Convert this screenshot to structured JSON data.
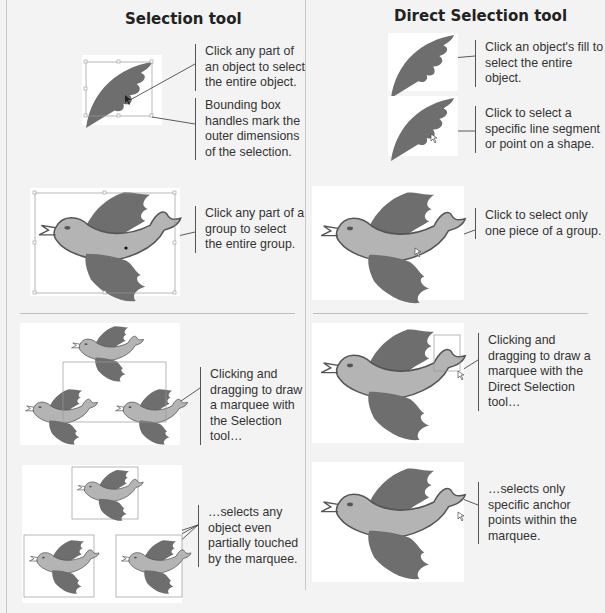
{
  "columns": [
    {
      "title": "Selection tool",
      "captions": [
        "Click any part of an object to select the entire object.",
        "Bounding box handles mark the outer dimensions of the selection.",
        "Click any part of a group to select the entire group.",
        "Clicking and dragging to draw a marquee with the Selection tool…",
        "…selects any object even partially touched by the marquee."
      ]
    },
    {
      "title": "Direct Selection tool",
      "captions": [
        "Click an object's fill to select the entire object.",
        "Click to select a specific line segment or point on a shape.",
        "Click to select only one piece of a group.",
        "Clicking and dragging to draw a marquee with the Direct Selection tool…",
        "…selects only specific anchor points within the marquee."
      ]
    }
  ],
  "colors": {
    "background": "#f3f3f3",
    "wing": "#6e6e6e",
    "body": "#b4b4b4",
    "selection": "#999999"
  }
}
